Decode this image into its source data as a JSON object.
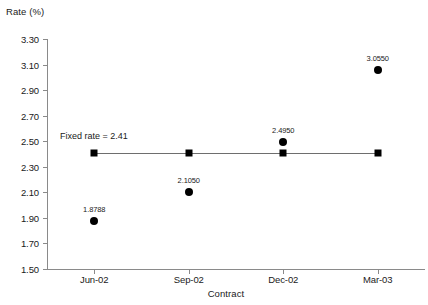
{
  "chart_data": {
    "type": "scatter",
    "title": "",
    "xlabel": "Contract",
    "ylabel": "Rate (%)",
    "categories": [
      "Jun-02",
      "Sep-02",
      "Dec-02",
      "Mar-03"
    ],
    "ylim": [
      1.5,
      3.3
    ],
    "ytick_labels": [
      "3.30",
      "3.10",
      "2.90",
      "2.70",
      "2.50",
      "2.30",
      "2.10",
      "1.90",
      "1.70",
      "1.50"
    ],
    "ytick_values": [
      3.3,
      3.1,
      2.9,
      2.7,
      2.5,
      2.3,
      2.1,
      1.9,
      1.7,
      1.5
    ],
    "grid": false,
    "legend": "none",
    "series": [
      {
        "name": "Market rate",
        "marker": "circle",
        "values": [
          1.8788,
          2.105,
          2.495,
          3.055
        ],
        "data_labels": [
          "1.8788",
          "2.1050",
          "2.4950",
          "3.0550"
        ]
      },
      {
        "name": "Fixed rate",
        "marker": "square",
        "values": [
          2.41,
          2.41,
          2.41,
          2.41
        ],
        "data_labels": [
          "",
          "",
          "",
          ""
        ]
      }
    ],
    "annotations": [
      {
        "text": "Fixed rate = 2.41",
        "x_category": "Jun-02",
        "y": 2.41
      }
    ]
  }
}
